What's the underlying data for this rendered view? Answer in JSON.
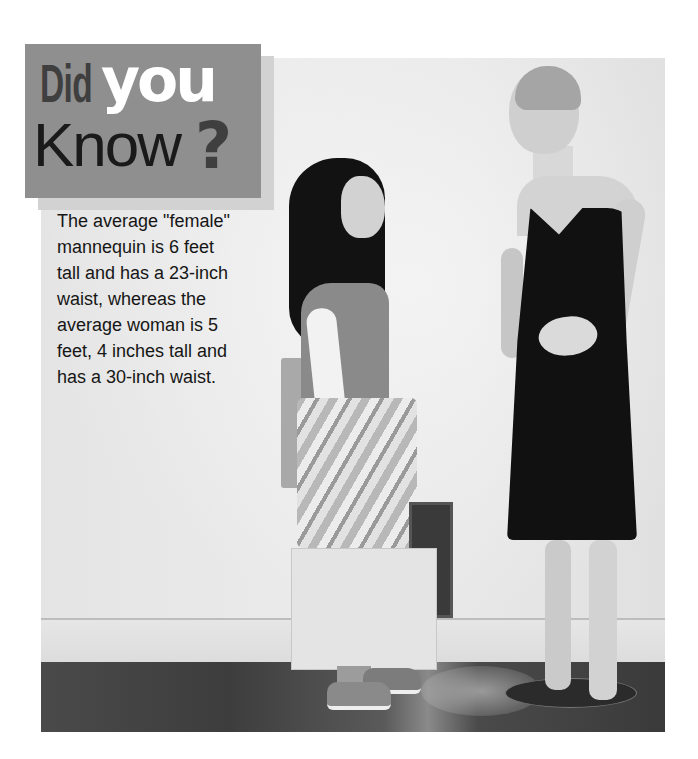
{
  "sidebar": {
    "title": {
      "word1": "Did",
      "word2": "you",
      "word3": "Know",
      "punctuation": "?"
    },
    "fact_lines": [
      "The average \"female\"",
      "mannequin is 6 feet",
      "tall and has a 23-inch",
      "waist, whereas the",
      "average woman is 5",
      "feet, 4 inches tall and",
      "has a 30-inch waist."
    ],
    "fact_full": "The average \"female\" mannequin is 6 feet tall and has a 23-inch waist, whereas the average woman is 5 feet, 4 inches tall and has a 30-inch waist."
  },
  "photo": {
    "description": "Grayscale photo of a young woman holding shopping bags looking up at a tall female mannequin in a black dress",
    "subjects": [
      "young-woman-with-shopping-bags",
      "mannequin-in-black-dress"
    ]
  },
  "colors": {
    "badge_bg": "#8f8f8f",
    "badge_shadow": "#d2d2d2",
    "title_dark": "#3f3f3f",
    "title_light": "#ffffff",
    "text": "#161616"
  }
}
